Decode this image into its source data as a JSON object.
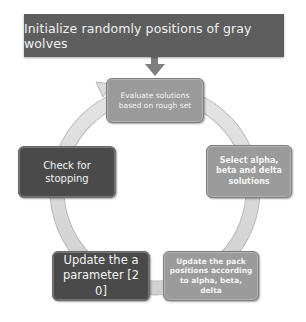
{
  "diagram": {
    "type": "cycle-flowchart",
    "start": {
      "label": "Initialize randomly positions of gray wolves",
      "color": "#5e5e5e"
    },
    "cycle_steps": [
      {
        "id": "evaluate",
        "label": "Evaluate solutions based on rough set",
        "color": "#9b9b9b"
      },
      {
        "id": "select",
        "label": "Select alpha, beta and delta solutions",
        "color": "#9b9b9b"
      },
      {
        "id": "update-pack",
        "label": "Update the pack positions according to alpha, beta, delta",
        "color": "#9b9b9b"
      },
      {
        "id": "update-a",
        "label": "Update the  a parameter [2 0]",
        "color": "#4a4a4a"
      },
      {
        "id": "check",
        "label": "Check for stopping",
        "color": "#4a4a4a"
      }
    ],
    "connector_color": "#d9d9d9",
    "arrow_color": "#7f7f7f"
  }
}
